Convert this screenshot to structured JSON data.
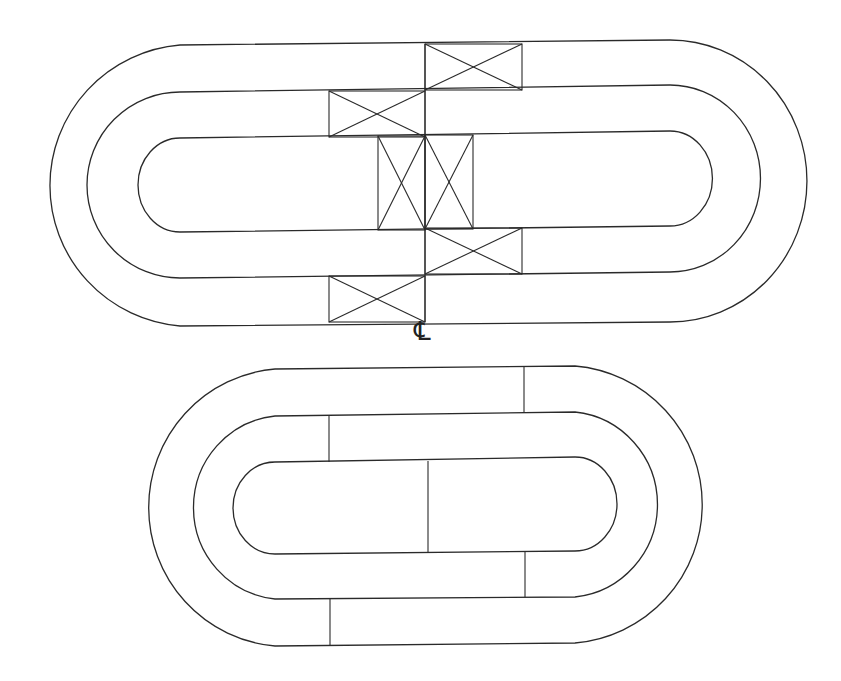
{
  "diagram": {
    "type": "track-layout",
    "centerline_symbol": "℄",
    "line_color": "#2a2a2a",
    "background": "#ffffff",
    "figures": [
      {
        "name": "upper-oval",
        "bands": 3,
        "note": "three concentric stadium outlines with diagonally crossed (X) blocks at the joints"
      },
      {
        "name": "lower-oval",
        "bands": 3,
        "note": "three concentric stadium outlines with staggered plain divider joints"
      }
    ]
  }
}
